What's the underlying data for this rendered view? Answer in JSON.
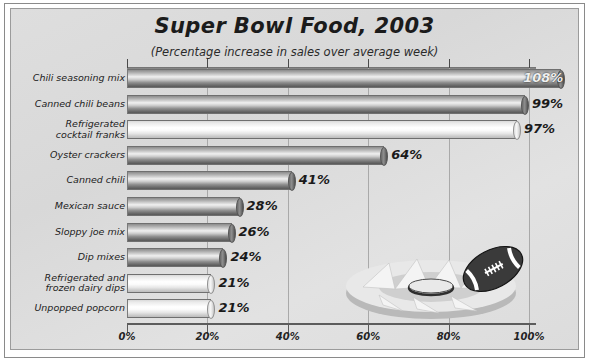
{
  "chart_data": {
    "type": "bar",
    "orientation": "horizontal",
    "title": "Super Bowl Food, 2003",
    "subtitle": "(Percentage increase in sales over average week)",
    "xlabel": "",
    "ylabel": "",
    "xlim": [
      0,
      110
    ],
    "grid": true,
    "legend": false,
    "xticks": [
      "0%",
      "20%",
      "40%",
      "60%",
      "80%",
      "100%"
    ],
    "xtick_values": [
      0,
      20,
      40,
      60,
      80,
      100
    ],
    "categories": [
      "Chili seasoning mix",
      "Canned chili beans",
      "Refrigerated cocktail franks",
      "Oyster crackers",
      "Canned chili",
      "Mexican sauce",
      "Sloppy joe mix",
      "Dip mixes",
      "Refrigerated and frozen dairy dips",
      "Unpopped popcorn"
    ],
    "values": [
      108,
      99,
      97,
      64,
      41,
      28,
      26,
      24,
      21,
      21
    ],
    "value_labels": [
      "108%",
      "99%",
      "97%",
      "64%",
      "41%",
      "28%",
      "26%",
      "24%",
      "21%",
      "21%"
    ]
  },
  "chart": {
    "rows": [
      {
        "label_line1": "Chili seasoning mix",
        "label_line2": "",
        "value": 108,
        "value_label": "108%",
        "shade": "dark",
        "label_inside": true
      },
      {
        "label_line1": "Canned chili beans",
        "label_line2": "",
        "value": 99,
        "value_label": "99%",
        "shade": "dark",
        "label_inside": false
      },
      {
        "label_line1": "Refrigerated",
        "label_line2": "cocktail franks",
        "value": 97,
        "value_label": "97%",
        "shade": "light",
        "label_inside": false
      },
      {
        "label_line1": "Oyster crackers",
        "label_line2": "",
        "value": 64,
        "value_label": "64%",
        "shade": "dark",
        "label_inside": false
      },
      {
        "label_line1": "Canned chili",
        "label_line2": "",
        "value": 41,
        "value_label": "41%",
        "shade": "dark",
        "label_inside": false
      },
      {
        "label_line1": "Mexican sauce",
        "label_line2": "",
        "value": 28,
        "value_label": "28%",
        "shade": "dark",
        "label_inside": false
      },
      {
        "label_line1": "Sloppy joe mix",
        "label_line2": "",
        "value": 26,
        "value_label": "26%",
        "shade": "dark",
        "label_inside": false
      },
      {
        "label_line1": "Dip mixes",
        "label_line2": "",
        "value": 24,
        "value_label": "24%",
        "shade": "dark",
        "label_inside": false
      },
      {
        "label_line1": "Refrigerated and",
        "label_line2": "frozen dairy dips",
        "value": 21,
        "value_label": "21%",
        "shade": "light",
        "label_inside": false
      },
      {
        "label_line1": "Unpopped popcorn",
        "label_line2": "",
        "value": 21,
        "value_label": "21%",
        "shade": "light",
        "label_inside": false
      }
    ],
    "colors": {
      "panel_background": "#dcdcdc",
      "frame_border": "#8a8a8a",
      "gridline": "#a9a9a9",
      "axis": "#5c5c5c",
      "text": "#1b1b1b",
      "bar_dark": "#8f8f8f",
      "bar_light": "#f2f2f2",
      "football": "#333333"
    }
  },
  "decoration": {
    "stadium_label": "stadium-bowl-graphic",
    "football_label": "football-graphic"
  }
}
